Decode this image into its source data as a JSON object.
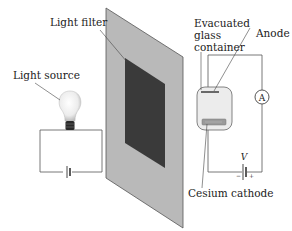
{
  "diagram": {
    "labels": {
      "light_filter": "Light filter",
      "light_source": "Light source",
      "evacuated_line1": "Evacuated",
      "evacuated_line2": "glass",
      "evacuated_line3": "container",
      "anode": "Anode",
      "cesium_cathode": "Cesium cathode",
      "voltage": "V",
      "ammeter": "A",
      "battery_minus": "−",
      "battery_plus": "+"
    },
    "colors": {
      "panel": "#b9b9b9",
      "panel_edge": "#555555",
      "filter": "#3a3a3a",
      "wire": "#555555",
      "tube": "#e8e8e8"
    }
  }
}
